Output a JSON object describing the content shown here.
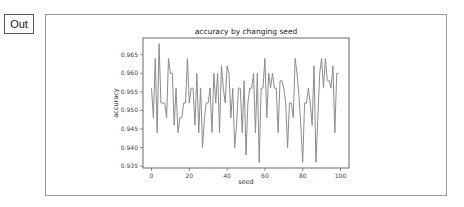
{
  "cell": {
    "prompt_label": "Out"
  },
  "chart_data": {
    "type": "line",
    "title": "accuracy by changing seed",
    "xlabel": "seed",
    "ylabel": "accuracy",
    "xlim": [
      -4.5,
      104.5
    ],
    "ylim": [
      0.9345,
      0.9695
    ],
    "xticks": [
      0,
      20,
      40,
      60,
      80,
      100
    ],
    "yticks": [
      0.935,
      0.94,
      0.945,
      0.95,
      0.955,
      0.96,
      0.965
    ],
    "ytick_labels": [
      "0.935",
      "0.940",
      "0.945",
      "0.950",
      "0.955",
      "0.960",
      "0.965"
    ],
    "xtick_labels": [
      "0",
      "20",
      "40",
      "60",
      "80",
      "100"
    ],
    "grid": false,
    "line_color": "#8c8c8c",
    "series": [
      {
        "name": "accuracy",
        "x": [
          0,
          1,
          2,
          3,
          4,
          5,
          6,
          7,
          8,
          9,
          10,
          11,
          12,
          13,
          14,
          15,
          16,
          17,
          18,
          19,
          20,
          21,
          22,
          23,
          24,
          25,
          26,
          27,
          28,
          29,
          30,
          31,
          32,
          33,
          34,
          35,
          36,
          37,
          38,
          39,
          40,
          41,
          42,
          43,
          44,
          45,
          46,
          47,
          48,
          49,
          50,
          51,
          52,
          53,
          54,
          55,
          56,
          57,
          58,
          59,
          60,
          61,
          62,
          63,
          64,
          65,
          66,
          67,
          68,
          69,
          70,
          71,
          72,
          73,
          74,
          75,
          76,
          77,
          78,
          79,
          80,
          81,
          82,
          83,
          84,
          85,
          86,
          87,
          88,
          89,
          90,
          91,
          92,
          93,
          94,
          95,
          96,
          97,
          98,
          99
        ],
        "values": [
          0.956,
          0.948,
          0.964,
          0.944,
          0.968,
          0.952,
          0.952,
          0.952,
          0.948,
          0.964,
          0.96,
          0.96,
          0.946,
          0.956,
          0.944,
          0.948,
          0.948,
          0.952,
          0.952,
          0.964,
          0.952,
          0.956,
          0.956,
          0.946,
          0.96,
          0.944,
          0.956,
          0.94,
          0.948,
          0.952,
          0.952,
          0.956,
          0.944,
          0.96,
          0.952,
          0.96,
          0.944,
          0.962,
          0.956,
          0.952,
          0.962,
          0.96,
          0.948,
          0.956,
          0.94,
          0.946,
          0.956,
          0.956,
          0.944,
          0.958,
          0.938,
          0.952,
          0.956,
          0.956,
          0.96,
          0.944,
          0.96,
          0.936,
          0.956,
          0.956,
          0.964,
          0.948,
          0.96,
          0.956,
          0.96,
          0.956,
          0.956,
          0.944,
          0.958,
          0.958,
          0.956,
          0.952,
          0.94,
          0.952,
          0.952,
          0.948,
          0.964,
          0.96,
          0.954,
          0.946,
          0.936,
          0.952,
          0.952,
          0.956,
          0.952,
          0.946,
          0.962,
          0.936,
          0.948,
          0.96,
          0.964,
          0.956,
          0.964,
          0.958,
          0.958,
          0.956,
          0.962,
          0.944,
          0.96,
          0.96
        ]
      }
    ]
  }
}
